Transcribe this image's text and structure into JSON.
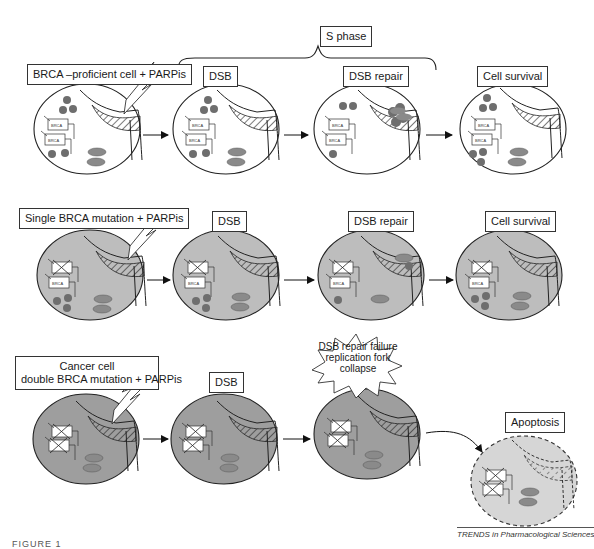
{
  "figure": {
    "phase_label": "S phase",
    "rows": [
      {
        "id": "proficient",
        "row_label": "BRCA –proficient cell + PARPis",
        "stages": [
          "DSB",
          "DSB repair",
          "Cell survival"
        ],
        "cell_fill": "#ffffff"
      },
      {
        "id": "single",
        "row_label": "Single BRCA mutation + PARPis",
        "stages": [
          "DSB",
          "DSB repair",
          "Cell survival"
        ],
        "cell_fill": "#bdbdbd"
      },
      {
        "id": "double",
        "row_label_line1": "Cancer cell",
        "row_label_line2": "double BRCA mutation + PARPis",
        "stages": [
          "DSB"
        ],
        "failure_line1": "DSB repair failure",
        "failure_line2": "replication fork",
        "failure_line3": "collapse",
        "outcome": "Apoptosis",
        "cell_fill": "#9e9e9e",
        "apoptosis_fill": "#d6d6d6"
      }
    ],
    "protein_labels": {
      "brca": "BRCA",
      "rad51": "RAD51"
    },
    "credit": "TRENDS in Pharmacological Sciences",
    "figure_caption": "FIGURE 1"
  },
  "colors": {
    "outline": "#2a2a2a",
    "dot": "#6e6e6e",
    "rad51_fill": "#8a8a8a",
    "lightning_fill": "#ffffff"
  }
}
